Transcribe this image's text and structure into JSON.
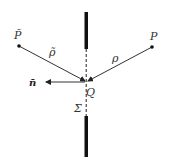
{
  "diagram": {
    "type": "aperture-diffraction-geometry",
    "labels": {
      "source_point": "P̃",
      "observation_point": "P",
      "aperture_point": "Q",
      "source_distance": "ρ̃",
      "observation_distance": "ρ",
      "normal": "n̄",
      "aperture_surface": "Σ"
    },
    "colors": {
      "screen": "#111111",
      "lines": "#333333",
      "background": "#ffffff"
    }
  }
}
